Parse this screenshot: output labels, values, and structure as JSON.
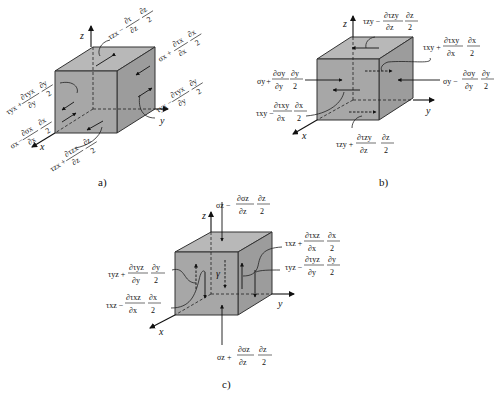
{
  "panels": [
    {
      "id": "a",
      "caption": "a)",
      "axes": {
        "x": "x",
        "y": "y",
        "z": "z"
      },
      "labels": [
        {
          "symbol": "τzx",
          "sign": "−",
          "num": "∂τ",
          "den": "∂z",
          "num2": "∂z",
          "den2": "2"
        },
        {
          "symbol": "σx",
          "sign": "+",
          "num": "∂τx",
          "den": "∂x",
          "num2": "∂x",
          "den2": "2"
        },
        {
          "symbol": "τyx",
          "sign": "−",
          "num": "∂τyx",
          "den": "∂y",
          "num2": "∂y",
          "den2": "2"
        },
        {
          "symbol": "τyx",
          "sign": "+",
          "num": "∂τyx",
          "den": "∂y",
          "num2": "∂y",
          "den2": "2"
        },
        {
          "symbol": "σx",
          "sign": "−",
          "num": "∂σx",
          "den": "∂x",
          "num2": "∂x",
          "den2": "2"
        },
        {
          "symbol": "τzx",
          "sign": "+",
          "num": "∂τzx",
          "den": "∂z",
          "num2": "∂z",
          "den2": "2"
        }
      ]
    },
    {
      "id": "b",
      "caption": "b)",
      "axes": {
        "x": "x",
        "y": "y",
        "z": "z"
      },
      "labels": [
        {
          "symbol": "τzy",
          "sign": "−",
          "num": "∂τzy",
          "den": "∂z",
          "num2": "∂z",
          "den2": "2"
        },
        {
          "symbol": "τxy",
          "sign": "+",
          "num": "∂τxy",
          "den": "∂x",
          "num2": "∂x",
          "den2": "2"
        },
        {
          "symbol": "σy",
          "sign": "+",
          "num": "∂σy",
          "den": "∂y",
          "num2": "∂y",
          "den2": "2"
        },
        {
          "symbol": "σy",
          "sign": "−",
          "num": "∂σy",
          "den": "∂y",
          "num2": "∂y",
          "den2": "2"
        },
        {
          "symbol": "τxy",
          "sign": "−",
          "num": "∂τxy",
          "den": "∂x",
          "num2": "∂x",
          "den2": "2"
        },
        {
          "symbol": "τzy",
          "sign": "+",
          "num": "∂τzy",
          "den": "∂z",
          "num2": "∂z",
          "den2": "2"
        }
      ]
    },
    {
      "id": "c",
      "caption": "c)",
      "axes": {
        "x": "x",
        "y": "y",
        "z": "z"
      },
      "center_label": "γ",
      "labels": [
        {
          "symbol": "σz",
          "sign": "−",
          "num": "∂σz",
          "den": "∂z",
          "num2": "∂z",
          "den2": "2"
        },
        {
          "symbol": "τxz",
          "sign": "+",
          "num": "∂τxz",
          "den": "∂x",
          "num2": "∂x",
          "den2": "2"
        },
        {
          "symbol": "τyz",
          "sign": "−",
          "num": "∂τyz",
          "den": "∂y",
          "num2": "∂y",
          "den2": "2"
        },
        {
          "symbol": "τyz",
          "sign": "+",
          "num": "∂τyz",
          "den": "∂y",
          "num2": "∂y",
          "den2": "2"
        },
        {
          "symbol": "τxz",
          "sign": "−",
          "num": "∂τxz",
          "den": "∂x",
          "num2": "∂x",
          "den2": "2"
        },
        {
          "symbol": "σz",
          "sign": "+",
          "num": "∂σz",
          "den": "∂z",
          "num2": "∂z",
          "den2": "2"
        }
      ]
    }
  ]
}
